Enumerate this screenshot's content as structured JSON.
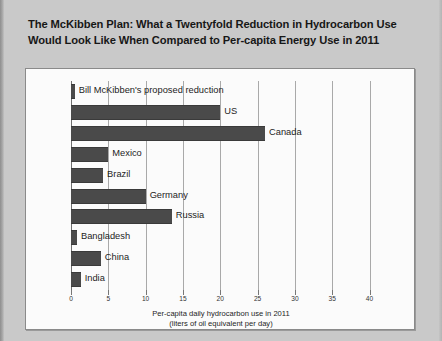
{
  "page": {
    "background_color": "#c9c9c9",
    "title_line1": "The McKibben Plan: What a Twentyfold Reduction in Hydrocarbon Use",
    "title_line2": "Would Look Like When Compared to Per-capita Energy Use in 2011"
  },
  "chart_data": {
    "type": "bar",
    "orientation": "horizontal",
    "title": "",
    "xlabel": "Per-capita daily hydrocarbon use in 2011",
    "xlabel_sub": "(liters of oil equivalent per day)",
    "ylabel": "",
    "xlim": [
      0,
      41
    ],
    "xticks": [
      0,
      5,
      10,
      15,
      20,
      25,
      30,
      35,
      40
    ],
    "xticklabels": [
      "0",
      "5",
      "10",
      "15",
      "20",
      "25",
      "30",
      "35",
      "40"
    ],
    "grid": true,
    "grid_axis": "x",
    "legend": "none",
    "bar_color": "#4a4a4a",
    "categories": [
      "Bill McKibben's proposed reduction",
      "US",
      "Canada",
      "Mexico",
      "Brazil",
      "Germany",
      "Russia",
      "Bangladesh",
      "China",
      "India"
    ],
    "values": [
      0.5,
      20.0,
      26.0,
      5.0,
      4.3,
      10.0,
      13.5,
      0.8,
      4.0,
      1.3
    ]
  }
}
